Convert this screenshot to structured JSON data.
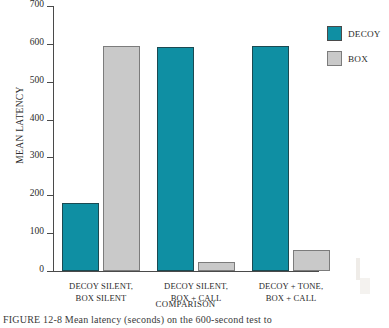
{
  "chart_data": {
    "type": "bar",
    "title": "",
    "xlabel": "COMPARISON",
    "ylabel": "MEAN LATENCY",
    "ylim": [
      0,
      700
    ],
    "yticks": [
      0,
      100,
      200,
      300,
      400,
      500,
      600,
      700
    ],
    "ytick_labels": [
      "0",
      "100",
      "200",
      "300",
      "400",
      "500",
      "600",
      "700"
    ],
    "grid": false,
    "legend_position": "right-top",
    "categories": [
      "DECOY SILENT, BOX SILENT",
      "DECOY SILENT, BOX + CALL",
      "DECOY + TONE, BOX + CALL"
    ],
    "category_lines": [
      [
        "DECOY SILENT,",
        "BOX SILENT"
      ],
      [
        "DECOY SILENT,",
        "BOX + CALL"
      ],
      [
        "DECOY + TONE,",
        "BOX + CALL"
      ]
    ],
    "series": [
      {
        "name": "DECOY",
        "color": "#0f8fa3",
        "values": [
          180,
          592,
          595
        ]
      },
      {
        "name": "BOX",
        "color": "#c9c9c9",
        "values": [
          595,
          24,
          55
        ]
      }
    ]
  },
  "legend": {
    "items": [
      {
        "label": "DECOY",
        "color": "#0f8fa3"
      },
      {
        "label": "BOX",
        "color": "#c9c9c9"
      }
    ]
  },
  "caption": {
    "figure_number": "FIGURE 12-8",
    "text": "Mean latency (seconds) on the 600-second test to",
    "full": "FIGURE 12-8  Mean latency (seconds) on the 600-second test to"
  }
}
